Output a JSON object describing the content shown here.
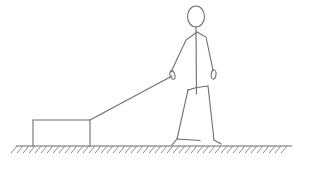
{
  "figure": {
    "title": "Stick figure pulling a box with a rope",
    "description": "Line drawing of a standing person leaning forward, holding a rope in the lowered left hand, which is attached to the upper right corner of a rectangular box resting on hatched ground.",
    "background_color": "#ffffff",
    "line_color": "#6e6e6e",
    "hatch_color": "#8a8a8a",
    "ground_color": "#6b6b6b",
    "canvas": {
      "width": 309,
      "height": 172
    }
  },
  "elements": {
    "person": {
      "label": "person",
      "head": {
        "label": "head",
        "cx": 196,
        "cy": 16.5,
        "rx": 8.5,
        "ry": 10.5
      },
      "spine": {
        "label": "torso-spine",
        "x1": 196,
        "y1": 27,
        "x2": 196.5,
        "y2": 94
      },
      "shoulder_left": {
        "label": "left-shoulder-arm",
        "points": "197,32 186,40 171,72"
      },
      "shoulder_right": {
        "label": "right-shoulder-arm",
        "points": "197,32 206,37 213,70"
      },
      "hand_left": {
        "label": "left-hand-gripping-rope",
        "cx": 172.4,
        "cy": 75,
        "rx": 2.4,
        "ry": 4.4,
        "rotate": -16
      },
      "hand_right": {
        "label": "right-hand",
        "cx": 213.6,
        "cy": 74.5,
        "rx": 2.4,
        "ry": 4.6,
        "rotate": 6
      },
      "hips": {
        "label": "hips-waist",
        "points": "188,90 196.5,87.5 208,86"
      },
      "leg_left": {
        "label": "left-leg",
        "points": "188,90 177,139"
      },
      "leg_right": {
        "label": "right-leg",
        "points": "208,86 214,140"
      },
      "skirt_hem": {
        "label": "skirt-hem",
        "points": "177,139 200,140.5"
      },
      "foot_left": {
        "label": "left-foot",
        "points": "177,139 172,145"
      },
      "foot_right": {
        "label": "right-foot",
        "points": "214,140 221,144"
      }
    },
    "rope": {
      "label": "rope",
      "points": "172,76 90,120"
    },
    "box": {
      "label": "box",
      "x": 33,
      "y": 120,
      "width": 57,
      "height": 26
    },
    "ground": {
      "label": "ground",
      "line_y": 146,
      "x_start": 16,
      "x_end": 292,
      "hatch_count": 46,
      "hatch_spacing": 6,
      "hatch_length": 7,
      "hatch_slant": 6
    }
  }
}
